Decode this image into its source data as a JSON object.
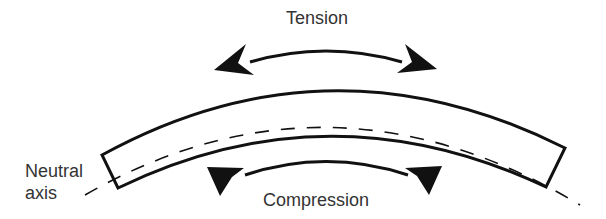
{
  "diagram": {
    "labels": {
      "tension": "Tension",
      "compression": "Compression",
      "neutral_line1": "Neutral",
      "neutral_line2": "axis"
    },
    "elements": [
      "curved-beam",
      "neutral-axis-dashed-line",
      "tension-double-arrow",
      "compression-inward-arrows"
    ],
    "colors": {
      "stroke": "#111111",
      "text": "#333333",
      "background": "#ffffff"
    }
  }
}
